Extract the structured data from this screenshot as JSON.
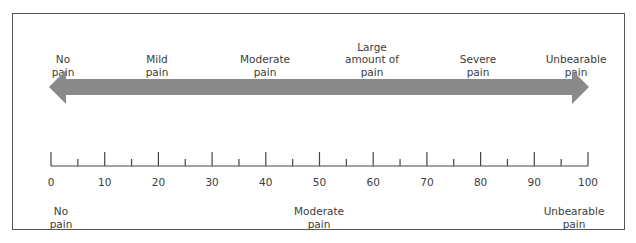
{
  "diagram": {
    "arrow_color": "#8a8a8a",
    "top_labels": [
      {
        "text": "No\npain",
        "x": 63
      },
      {
        "text": "Mild\npain",
        "x": 157
      },
      {
        "text": "Moderate\npain",
        "x": 265
      },
      {
        "text": "Large\namount of\npain",
        "x": 372
      },
      {
        "text": "Severe\npain",
        "x": 478
      },
      {
        "text": "Unbearable\npain",
        "x": 576
      }
    ],
    "scale": {
      "min": 0,
      "max": 100,
      "major_step": 10,
      "minor_step": 5,
      "tick_labels": [
        "0",
        "10",
        "20",
        "30",
        "40",
        "50",
        "60",
        "70",
        "80",
        "90",
        "100"
      ]
    },
    "bottom_labels": [
      {
        "text": "No\npain",
        "x": 61
      },
      {
        "text": "Moderate\npain",
        "x": 319
      },
      {
        "text": "Unbearable\npain",
        "x": 574
      }
    ]
  }
}
